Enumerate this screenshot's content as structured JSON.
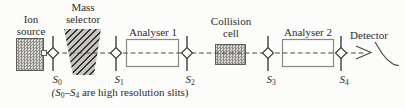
{
  "labels": {
    "ion_source": [
      "Ion",
      "source"
    ],
    "mass_selector": [
      "Mass",
      "selector"
    ],
    "analyser_1": "Analyser 1",
    "collision_cell": [
      "Collision",
      "cell"
    ],
    "analyser_2": "Analyser 2",
    "detector": "Detector"
  },
  "slits": [
    {
      "base": "S",
      "sub": "0"
    },
    {
      "base": "S",
      "sub": "1"
    },
    {
      "base": "S",
      "sub": "2"
    },
    {
      "base": "S",
      "sub": "3"
    },
    {
      "base": "S",
      "sub": "4"
    }
  ],
  "caption": {
    "lead": "(S",
    "sub_start": "0",
    "join": "–S",
    "sub_end": "4",
    "tail": " are high resolution slits)"
  },
  "colors": {
    "background": "#fcfcfa",
    "text": "#2e2d2b",
    "beam_line": "#4a4948",
    "box_border": "#5f5d5a",
    "stipple_dot": "#8f8d89",
    "hatch_dark": "#33312e",
    "analyser_border": "#8a8884"
  }
}
